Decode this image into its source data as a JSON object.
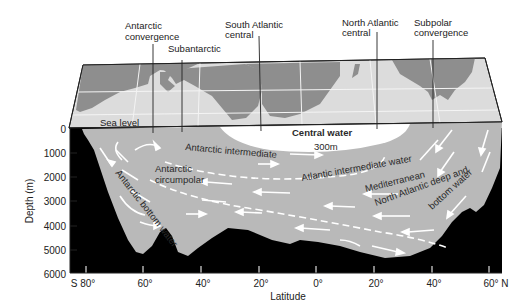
{
  "diagram": {
    "colors": {
      "seafloor": "#000000",
      "water": "#b9b9b9",
      "central_water": "#ffffff",
      "map_ocean": "#dcdcdc",
      "map_land": "#8e8e8e",
      "arrows": "#ffffff"
    },
    "callouts": [
      {
        "lines": [
          "Antarctic",
          "convergence"
        ]
      },
      {
        "lines": [
          "Subantarctic"
        ]
      },
      {
        "lines": [
          "South Atlantic",
          "central"
        ]
      },
      {
        "lines": [
          "North Atlantic",
          "central"
        ]
      },
      {
        "lines": [
          "Subpolar",
          "convergence"
        ]
      }
    ],
    "sea_level_label": "Sea level",
    "water_labels": {
      "central_water": "Central water",
      "depth_300": "300m",
      "antarctic_intermediate": "Antarctic intermediate",
      "antarctic_circumpolar_1": "Antarctic",
      "antarctic_circumpolar_2": "circumpolar",
      "antarctic_bottom": "Antarctic bottom water",
      "atlantic_intermediate": "Atlantic intermediate water",
      "mediterranean": "Mediterranean",
      "north_atlantic_deep_1": "North Atlantic deep and",
      "north_atlantic_deep_2": "bottom water"
    },
    "y_axis": {
      "label": "Depth (m)",
      "ticks": [
        "0",
        "1000",
        "2000",
        "3000",
        "4000",
        "5000",
        "6000"
      ]
    },
    "x_axis": {
      "label": "Latitude",
      "ticks": [
        "S 80°",
        "60°",
        "40°",
        "20°",
        "0°",
        "20°",
        "40°",
        "60° N"
      ]
    }
  }
}
